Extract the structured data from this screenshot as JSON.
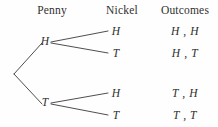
{
  "diagram": {
    "type": "probability-tree",
    "title": "",
    "columns": [
      {
        "label": "Penny"
      },
      {
        "label": "Nickel"
      },
      {
        "label": "Outcomes"
      }
    ],
    "root": {
      "label": ""
    },
    "level1": [
      {
        "label": "H"
      },
      {
        "label": "T"
      }
    ],
    "level2": [
      {
        "label": "H"
      },
      {
        "label": "T"
      },
      {
        "label": "H"
      },
      {
        "label": "T"
      }
    ],
    "outcomes": [
      {
        "label": "H , H"
      },
      {
        "label": "H , T"
      },
      {
        "label": "T , H"
      },
      {
        "label": "T , T"
      }
    ],
    "colors": {
      "background": "#fefefe",
      "text": "#2e2e2d",
      "line": "#3a3a3a"
    }
  }
}
